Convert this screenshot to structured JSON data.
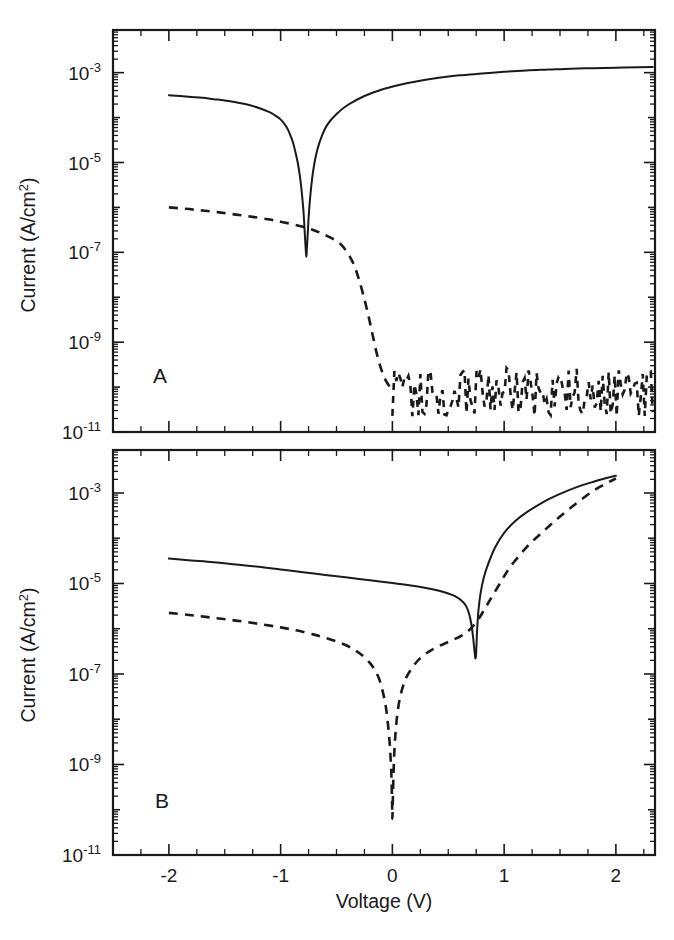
{
  "figure": {
    "title": "",
    "panel_labels": [
      "A",
      "B"
    ],
    "axis_color": "#1a1a1a",
    "background": "#ffffff"
  },
  "axes": {
    "xlabel": "Voltage (V)",
    "ylabel_prefix": "Current (A/cm",
    "ylabel_exp": "2",
    "ylabel_suffix": ")",
    "ylabel_full": "Current (A/cm2)",
    "xticklabels": [
      "-2",
      "-1",
      "0",
      "1",
      "2"
    ],
    "xtickvalues": [
      -2,
      -1,
      0,
      1,
      2
    ],
    "yticklabels": [
      "10",
      "10",
      "10",
      "10",
      "10"
    ],
    "ytickexponents": [
      "-3",
      "-5",
      "-7",
      "-9",
      "-11"
    ],
    "ytickvalues": [
      -3,
      -5,
      -7,
      -9,
      -11
    ]
  },
  "chart_data": [
    {
      "id": "panel-a",
      "type": "line",
      "panel": "A",
      "title": "",
      "xlabel": "Voltage (V)",
      "ylabel": "Current (A/cm2)",
      "xlim": [
        -2.5,
        2.35
      ],
      "ylim": [
        -11,
        -2.05
      ],
      "yscale": "log10",
      "grid": false,
      "legend": "none",
      "xticks_major": [
        -2,
        -1,
        0,
        1,
        2
      ],
      "xtick_step_minor": 0.25,
      "yticks_major": [
        -3,
        -5,
        -7,
        -9,
        -11
      ],
      "series": [
        {
          "name": "solid",
          "style": "solid",
          "x": [
            -2.0,
            -1.9,
            -1.8,
            -1.7,
            -1.6,
            -1.5,
            -1.4,
            -1.3,
            -1.2,
            -1.1,
            -1.05,
            -1.0,
            -0.95,
            -0.92,
            -0.89,
            -0.86,
            -0.84,
            -0.82,
            -0.8,
            -0.79,
            -0.78,
            -0.775,
            -0.772,
            -0.77,
            -0.768,
            -0.765,
            -0.76,
            -0.75,
            -0.74,
            -0.72,
            -0.7,
            -0.67,
            -0.63,
            -0.58,
            -0.5,
            -0.4,
            -0.25,
            -0.1,
            0.05,
            0.2,
            0.4,
            0.6,
            0.8,
            1.0,
            1.2,
            1.4,
            1.6,
            1.8,
            2.0,
            2.2,
            2.33
          ],
          "y": [
            -3.5,
            -3.52,
            -3.54,
            -3.56,
            -3.59,
            -3.62,
            -3.66,
            -3.71,
            -3.78,
            -3.88,
            -3.95,
            -4.04,
            -4.2,
            -4.35,
            -4.55,
            -4.85,
            -5.1,
            -5.45,
            -5.95,
            -6.3,
            -6.75,
            -6.95,
            -7.05,
            -7.1,
            -7.05,
            -6.9,
            -6.7,
            -6.25,
            -5.9,
            -5.4,
            -5.05,
            -4.7,
            -4.4,
            -4.15,
            -3.92,
            -3.72,
            -3.52,
            -3.38,
            -3.28,
            -3.2,
            -3.12,
            -3.06,
            -3.02,
            -2.98,
            -2.95,
            -2.93,
            -2.91,
            -2.9,
            -2.89,
            -2.88,
            -2.875
          ]
        },
        {
          "name": "dashed",
          "style": "dashed",
          "x": [
            -2.0,
            -1.85,
            -1.7,
            -1.55,
            -1.4,
            -1.25,
            -1.1,
            -1.0,
            -0.9,
            -0.8,
            -0.72,
            -0.65,
            -0.58,
            -0.5,
            -0.44,
            -0.38,
            -0.34,
            -0.3,
            -0.26,
            -0.22,
            -0.18,
            -0.14,
            -0.1,
            -0.06,
            -0.02
          ],
          "y": [
            -6.0,
            -6.03,
            -6.07,
            -6.11,
            -6.16,
            -6.21,
            -6.27,
            -6.32,
            -6.37,
            -6.43,
            -6.49,
            -6.56,
            -6.64,
            -6.75,
            -6.88,
            -7.1,
            -7.3,
            -7.6,
            -7.95,
            -8.35,
            -8.8,
            -9.25,
            -9.6,
            -9.85,
            -10.0
          ],
          "note": "reverse-bias leakage branch before noise floor"
        },
        {
          "name": "dashed-noise-floor",
          "style": "dashed-noise",
          "noise_level_log10": -10.1,
          "noise_amplitude_decades": 0.55,
          "x_start": 0.0,
          "x_end": 2.33,
          "points": 130,
          "note": "noise-limited measurement floor around 1e-10 A/cm2"
        }
      ]
    },
    {
      "id": "panel-b",
      "type": "line",
      "panel": "B",
      "title": "",
      "xlabel": "Voltage (V)",
      "ylabel": "Current (A/cm2)",
      "xlim": [
        -2.5,
        2.35
      ],
      "ylim": [
        -11,
        -2.05
      ],
      "yscale": "log10",
      "grid": false,
      "legend": "none",
      "xticks_major": [
        -2,
        -1,
        0,
        1,
        2
      ],
      "xtick_step_minor": 0.25,
      "yticks_major": [
        -3,
        -5,
        -7,
        -9,
        -11
      ],
      "series": [
        {
          "name": "solid",
          "style": "solid",
          "x": [
            -2.0,
            -1.8,
            -1.6,
            -1.4,
            -1.2,
            -1.0,
            -0.8,
            -0.6,
            -0.4,
            -0.2,
            0.0,
            0.15,
            0.3,
            0.4,
            0.5,
            0.56,
            0.62,
            0.66,
            0.69,
            0.71,
            0.725,
            0.735,
            0.742,
            0.748,
            0.752,
            0.758,
            0.77,
            0.79,
            0.82,
            0.86,
            0.92,
            1.0,
            1.1,
            1.2,
            1.35,
            1.5,
            1.65,
            1.8,
            1.9,
            1.98,
            2.0
          ],
          "y": [
            -4.45,
            -4.49,
            -4.53,
            -4.58,
            -4.63,
            -4.69,
            -4.75,
            -4.81,
            -4.87,
            -4.93,
            -4.99,
            -5.04,
            -5.1,
            -5.15,
            -5.22,
            -5.28,
            -5.38,
            -5.5,
            -5.7,
            -5.95,
            -6.25,
            -6.5,
            -6.65,
            -6.6,
            -6.4,
            -6.05,
            -5.6,
            -5.2,
            -4.85,
            -4.55,
            -4.2,
            -3.88,
            -3.62,
            -3.43,
            -3.2,
            -3.02,
            -2.87,
            -2.75,
            -2.68,
            -2.63,
            -2.62
          ]
        },
        {
          "name": "dashed",
          "style": "dashed",
          "x": [
            -2.0,
            -1.8,
            -1.6,
            -1.4,
            -1.2,
            -1.0,
            -0.85,
            -0.7,
            -0.6,
            -0.5,
            -0.42,
            -0.35,
            -0.3,
            -0.25,
            -0.2,
            -0.16,
            -0.12,
            -0.09,
            -0.06,
            -0.04,
            -0.025,
            -0.015,
            -0.008,
            -0.003,
            0.0,
            0.004,
            0.01,
            0.02,
            0.035,
            0.055,
            0.08,
            0.12,
            0.18,
            0.25,
            0.33,
            0.42,
            0.52,
            0.62,
            0.7,
            0.78,
            0.86,
            0.95,
            1.05,
            1.2,
            1.35,
            1.5,
            1.65,
            1.8,
            1.92,
            2.0
          ],
          "y": [
            -5.65,
            -5.7,
            -5.76,
            -5.82,
            -5.89,
            -5.97,
            -6.04,
            -6.13,
            -6.2,
            -6.28,
            -6.36,
            -6.45,
            -6.53,
            -6.63,
            -6.76,
            -6.9,
            -7.1,
            -7.35,
            -7.7,
            -8.1,
            -8.5,
            -8.9,
            -9.3,
            -9.8,
            -10.2,
            -9.8,
            -9.2,
            -8.6,
            -8.1,
            -7.7,
            -7.4,
            -7.1,
            -6.85,
            -6.65,
            -6.5,
            -6.38,
            -6.27,
            -6.15,
            -6.0,
            -5.75,
            -5.42,
            -5.05,
            -4.65,
            -4.2,
            -3.85,
            -3.52,
            -3.22,
            -2.95,
            -2.78,
            -2.68
          ]
        }
      ]
    }
  ]
}
